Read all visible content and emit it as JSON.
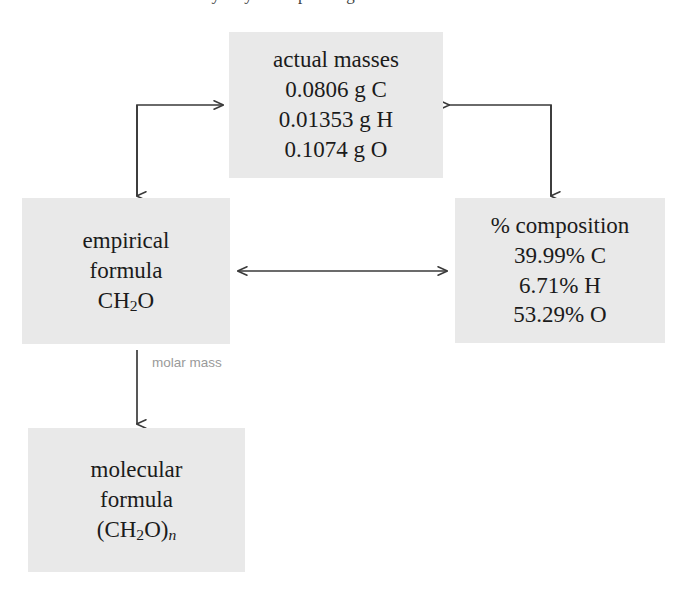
{
  "page": {
    "background_color": "#ffffff",
    "box_fill_color": "#e9e9e9",
    "line_color": "#3a3a3a",
    "text_color": "#1b1b1b",
    "partial_top_text": "many ways of expressing the same information."
  },
  "diagram": {
    "type": "flow-diagram",
    "title_fragment": "many ways of expressing the same information.",
    "boxes": [
      {
        "id": "actual-masses",
        "heading": "actual masses",
        "lines": [
          "0.0806 g C",
          "0.01353 g H",
          "0.1074 g O"
        ],
        "values": [
          {
            "element": "C",
            "mass": 0.0806,
            "unit": "g"
          },
          {
            "element": "H",
            "mass": 0.01353,
            "unit": "g"
          },
          {
            "element": "O",
            "mass": 0.1074,
            "unit": "g"
          }
        ]
      },
      {
        "id": "empirical-formula",
        "heading_line1": "empirical",
        "heading_line2": "formula",
        "formula_pre": "CH",
        "formula_sub": "2",
        "formula_post": "O"
      },
      {
        "id": "percent-composition",
        "heading": "% composition",
        "lines": [
          "39.99% C",
          "6.71% H",
          "53.29% O"
        ],
        "values": [
          {
            "element": "C",
            "percent": 39.99
          },
          {
            "element": "H",
            "percent": 6.71
          },
          {
            "element": "O",
            "percent": 53.29
          }
        ]
      },
      {
        "id": "molecular-formula",
        "heading_line1": "molecular",
        "heading_line2": "formula",
        "formula_pre": "(CH",
        "formula_sub": "2",
        "formula_mid": "O)",
        "formula_italic_sub": "n"
      }
    ],
    "edge_labels": {
      "molar_mass": "molar mass"
    },
    "connectors": [
      {
        "from": "empirical-formula",
        "to": "actual-masses",
        "style": "elbow",
        "heads": "both"
      },
      {
        "from": "actual-masses",
        "to": "percent-composition",
        "style": "elbow",
        "heads": "both"
      },
      {
        "from": "empirical-formula",
        "to": "percent-composition",
        "style": "straight",
        "heads": "both"
      },
      {
        "from": "empirical-formula",
        "to": "molecular-formula",
        "style": "straight",
        "heads": "end",
        "label": "molar mass"
      }
    ]
  }
}
